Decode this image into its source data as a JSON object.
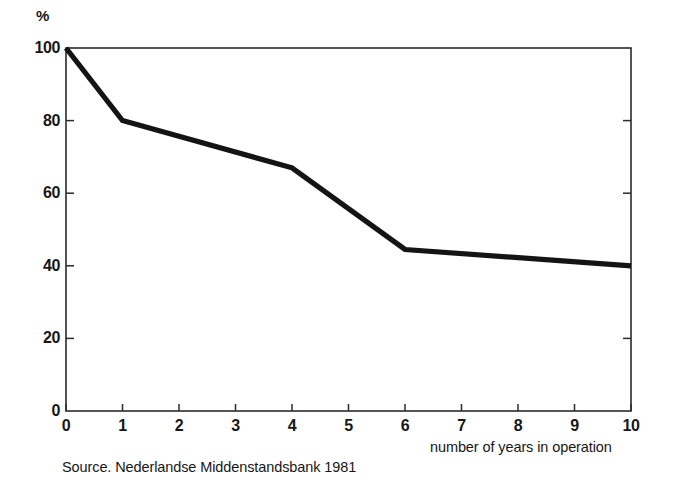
{
  "chart_data": {
    "type": "line",
    "title": "",
    "subtitle": "",
    "xlabel": "number of years in operation",
    "ylabel": "%",
    "ylim": [
      0,
      100
    ],
    "xlim": [
      0,
      10
    ],
    "grid": false,
    "legend": "none",
    "x": [
      0,
      1,
      4,
      6,
      10
    ],
    "values": [
      100,
      80,
      67,
      44.5,
      40
    ],
    "series": [
      {
        "name": "surviving businesses",
        "x": [
          0,
          1,
          4,
          6,
          10
        ],
        "values": [
          100,
          80,
          67,
          44.5,
          40
        ]
      }
    ],
    "x_ticks": [
      "0",
      "1",
      "2",
      "3",
      "4",
      "5",
      "6",
      "7",
      "8",
      "9",
      "10"
    ],
    "x_tick_values": [
      0,
      1,
      2,
      3,
      4,
      5,
      6,
      7,
      8,
      9,
      10
    ],
    "y_ticks": [
      "0",
      "20",
      "40",
      "60",
      "80",
      "100"
    ],
    "y_tick_values": [
      0,
      20,
      40,
      60,
      80,
      100
    ],
    "annotations": [],
    "source": "Source. Nederlandse Middenstandsbank 1981",
    "line_color": "#141414",
    "axis_color": "#2b2b2b",
    "background_color": "#ffffff"
  },
  "axes": {
    "y_unit": "%",
    "x_title": "number of years in operation"
  },
  "caption": {
    "source_text": "Source. Nederlandse Middenstandsbank 1981"
  }
}
